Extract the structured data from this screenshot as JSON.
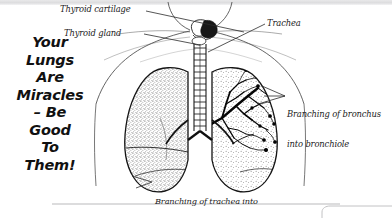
{
  "page": {
    "background_color": "#ffffff",
    "ink_color": "#111111",
    "top_bar_color": "#dcdcde"
  },
  "slogan": {
    "lines": [
      "Your",
      "Lungs",
      "Are",
      "Miracles",
      "– Be",
      "Good",
      "To",
      "Them!"
    ]
  },
  "annotations": {
    "thyroid_cartilage": "Thyroid cartilage",
    "thyroid_gland": "Thyroid gland",
    "trachea": "Trachea",
    "bronchus_line1": "Branching of bronchus",
    "bronchus_line2": "into bronchiole",
    "bronchi_line1": "Branching of trachea into",
    "bronchi_line2": "right and left bronchi"
  },
  "illustration": {
    "name": "human-lungs-anatomy-diagram",
    "parts": [
      "neck-outline",
      "shoulder-outline",
      "thyroid-cartilage",
      "thyroid-gland",
      "trachea-with-cartilage-rings",
      "left-lung-stippled",
      "right-lung-with-bronchial-tree",
      "diaphragm-line"
    ]
  },
  "footer": {
    "rule": "horizontal-rule",
    "shape": "rounded-rectangle-fragment"
  }
}
